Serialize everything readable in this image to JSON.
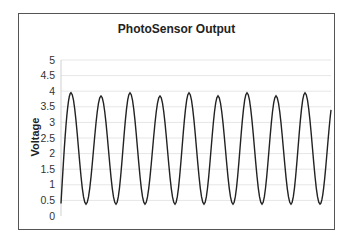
{
  "chart_data": {
    "type": "line",
    "title": "PhotoSensor Output",
    "xlabel": "",
    "ylabel": "Voltage",
    "ylim": [
      0,
      5
    ],
    "yticks": [
      "0",
      "0.5",
      "1",
      "1.5",
      "2",
      "2.5",
      "3",
      "3.5",
      "4",
      "4.5",
      "5"
    ],
    "grid": true,
    "legend": "none",
    "series": [
      {
        "name": "Voltage",
        "description": "Periodic oscillation, ~9 cycles; peaks alternate ~3.95 and ~3.85, troughs ~0.38",
        "peaks": [
          3.95,
          3.85,
          3.95,
          3.85,
          3.95,
          3.85,
          3.95,
          3.85,
          3.95
        ],
        "troughs": [
          0.38,
          0.38,
          0.38,
          0.38,
          0.38,
          0.38,
          0.38,
          0.38,
          0.38
        ],
        "start_value": 0.4,
        "end_value": 3.4
      }
    ],
    "colors": {
      "line": "#222222",
      "grid": "#e6e6e6",
      "frame": "#555555"
    }
  }
}
